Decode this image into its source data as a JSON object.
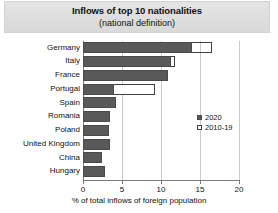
{
  "chart": {
    "title": "Inflows of top 10 nationalities",
    "subtitle": "(national definition)"
  },
  "legend": {
    "items": [
      {
        "label": "2020",
        "style": "filled",
        "color": "#595959"
      },
      {
        "label": "2010-19",
        "style": "hollow",
        "color": "#ffffff"
      }
    ]
  },
  "axis": {
    "x_caption": "% of total inflows of foreign population",
    "ticks": [
      "0",
      "5",
      "10",
      "15",
      "20"
    ]
  },
  "chart_data": {
    "type": "bar",
    "orientation": "horizontal",
    "title": "Inflows of top 10 nationalities",
    "subtitle": "(national definition)",
    "xlabel": "% of total inflows of foreign population",
    "ylabel": "",
    "xlim": [
      0,
      20
    ],
    "xticks": [
      0,
      5,
      10,
      15,
      20
    ],
    "grid": true,
    "legend_position": "middle-right",
    "categories": [
      "Germany",
      "Italy",
      "France",
      "Portugal",
      "Spain",
      "Romania",
      "Poland",
      "United Kingdom",
      "China",
      "Hungary"
    ],
    "series": [
      {
        "name": "2020",
        "color": "#595959",
        "values": [
          14.0,
          11.3,
          10.9,
          4.0,
          4.2,
          3.5,
          3.3,
          3.5,
          2.4,
          2.8
        ]
      },
      {
        "name": "2010-19",
        "color": "#ffffff",
        "values": [
          16.6,
          11.8,
          10.9,
          9.2,
          4.2,
          3.2,
          3.0,
          3.5,
          2.4,
          2.8
        ]
      }
    ]
  }
}
